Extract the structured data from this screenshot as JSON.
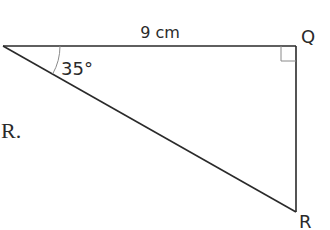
{
  "diagram": {
    "type": "right-triangle",
    "vertices": {
      "left": {
        "label": "",
        "x": 3,
        "y": 46
      },
      "Q": {
        "label": "Q",
        "x": 296,
        "y": 46
      },
      "R": {
        "label": "R",
        "x": 296,
        "y": 212
      }
    },
    "side_labels": {
      "top": "9 cm"
    },
    "angle_labels": {
      "left": "35°"
    },
    "right_angle_at": "Q",
    "stray_text": "R.",
    "colors": {
      "line": "#2a2a2a",
      "thin_line": "#8a8a8a",
      "background": "#ffffff"
    }
  }
}
